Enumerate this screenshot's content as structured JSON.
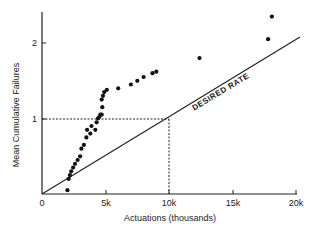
{
  "chart_data": {
    "type": "scatter",
    "title": "",
    "xlabel": "Actuations (thousands)",
    "ylabel": "Mean Cumulative Failures",
    "xlim": [
      0,
      20000
    ],
    "ylim": [
      0,
      2.4
    ],
    "x_ticks": [
      "0",
      "5k",
      "10k",
      "15k",
      "20k"
    ],
    "y_ticks": [
      "1",
      "2"
    ],
    "grid": false,
    "annotations": [
      {
        "text": "DESIRED RATE",
        "type": "line-label"
      },
      {
        "text": "dashed reference lines at y=1 and x=10k",
        "type": "guide"
      }
    ],
    "series": [
      {
        "name": "Observed",
        "type": "scatter",
        "x": [
          2000,
          2100,
          2200,
          2300,
          2450,
          2600,
          2800,
          3000,
          3100,
          3300,
          3500,
          3550,
          3800,
          3900,
          4200,
          4300,
          4400,
          4500,
          4600,
          4700,
          4750,
          4700,
          4800,
          4900,
          5100,
          6000,
          7000,
          7500,
          8000,
          8700,
          9000,
          12400,
          17800,
          18100
        ],
        "y": [
          0.05,
          0.2,
          0.25,
          0.3,
          0.35,
          0.4,
          0.45,
          0.5,
          0.6,
          0.65,
          0.75,
          0.85,
          0.8,
          0.9,
          0.85,
          0.95,
          1.0,
          1.02,
          1.05,
          1.05,
          1.15,
          1.25,
          1.3,
          1.35,
          1.38,
          1.4,
          1.45,
          1.5,
          1.55,
          1.6,
          1.62,
          1.8,
          2.05,
          2.35
        ]
      },
      {
        "name": "Desired Rate",
        "type": "line",
        "x": [
          0,
          20000
        ],
        "y": [
          0,
          2.0
        ]
      }
    ]
  },
  "labels": {
    "xlabel": "Actuations (thousands)",
    "ylabel": "Mean Cumulative Failures",
    "line_label": "DESIRED RATE",
    "x0": "0",
    "x5": "5k",
    "x10": "10k",
    "x15": "15k",
    "x20": "20k",
    "y1": "1",
    "y2": "2"
  }
}
